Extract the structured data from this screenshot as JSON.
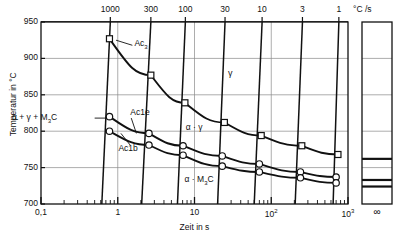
{
  "figure": {
    "kind": "continuous-heating-transformation-diagram",
    "axes": {
      "y": {
        "title": "Temperatur in °C",
        "min": 700,
        "max": 950,
        "ticks": [
          "700",
          "750",
          "800",
          "850",
          "900",
          "950"
        ],
        "tickvals": [
          700,
          750,
          800,
          850,
          900,
          950
        ]
      },
      "x": {
        "title": "Zeit in s",
        "min": -1,
        "max": 3,
        "ticks": [
          "0,1",
          "1",
          "10",
          "10",
          "10"
        ],
        "tick_labels": [
          "0,1",
          "1",
          "10",
          "10²",
          "10³"
        ],
        "tick_exponents": [
          "",
          "",
          "",
          "2",
          "3"
        ],
        "tickvals": [
          -1,
          0,
          1,
          2,
          3
        ],
        "infinity_label": "∞"
      },
      "top": {
        "title": "°C /s",
        "ticks": [
          "1000",
          "300",
          "100",
          "30",
          "10",
          "3",
          "1"
        ],
        "tickvals": [
          1000,
          300,
          100,
          30,
          10,
          3,
          1
        ]
      }
    },
    "region_labels": [
      {
        "name": "gamma",
        "text": "γ"
      },
      {
        "name": "alpha-gamma",
        "text": "α + γ"
      },
      {
        "name": "alpha-gamma-m3c",
        "text": "α + γ + M"
      },
      {
        "name": "alpha-m3c",
        "text": "α + M"
      }
    ],
    "region_labels_sub": {
      "m3c_sub": "3",
      "m3c_tail": "C"
    },
    "curve_labels": [
      {
        "name": "ac3",
        "text": "Ac",
        "sub": "3"
      },
      {
        "name": "ac1e",
        "text": "Ac1e"
      },
      {
        "name": "ac1b",
        "text": "Ac1b"
      }
    ],
    "colors": {
      "ink": "#111111",
      "grid": "#8a8a8a",
      "frame": "#111111"
    }
  },
  "chart_data": {
    "type": "line",
    "title": "",
    "xlabel": "Zeit in s",
    "ylabel": "Temperatur in °C",
    "xscale": "log",
    "xlim": [
      0.1,
      1000
    ],
    "ylim": [
      700,
      950
    ],
    "grid": true,
    "legend": "none",
    "top_axis": {
      "label": "°C /s",
      "name": "heating-rate",
      "values": [
        1000,
        300,
        100,
        30,
        10,
        3,
        1
      ]
    },
    "heating_rate_lines": [
      {
        "rate": 1000,
        "x_top": 0.8,
        "x_bottom": 0.62
      },
      {
        "rate": 300,
        "x_top": 2.7,
        "x_bottom": 2.05
      },
      {
        "rate": 100,
        "x_top": 7.6,
        "x_bottom": 6.0
      },
      {
        "rate": 30,
        "x_top": 25.0,
        "x_bottom": 20.0
      },
      {
        "rate": 10,
        "x_top": 76.0,
        "x_bottom": 60.0
      },
      {
        "rate": 3,
        "x_top": 255.0,
        "x_bottom": 205.0
      },
      {
        "rate": 1,
        "x_top": 760.0,
        "x_bottom": 640.0
      }
    ],
    "series": [
      {
        "name": "Ac3",
        "marker": "square",
        "x": [
          0.78,
          2.7,
          7.5,
          24.5,
          74.0,
          250.0,
          740.0
        ],
        "y": [
          927,
          877,
          839,
          812,
          794,
          780,
          768
        ]
      },
      {
        "name": "Ac1e",
        "marker": "circle",
        "x": [
          0.78,
          2.55,
          7.1,
          23.0,
          70.0,
          240.0,
          700.0
        ],
        "y": [
          820,
          797,
          780,
          766,
          755,
          744,
          737
        ]
      },
      {
        "name": "Ac1b",
        "marker": "circle",
        "x": [
          0.78,
          2.55,
          7.1,
          23.0,
          70.0,
          240.0,
          700.0
        ],
        "y": [
          800,
          781,
          767,
          752,
          744,
          736,
          729
        ]
      }
    ],
    "equilibrium_panel": {
      "x_label": "∞",
      "lines": [
        {
          "name": "Ac3-equilibrium",
          "y": 762
        },
        {
          "name": "Ac1e-equilibrium",
          "y": 733
        },
        {
          "name": "Ac1b-equilibrium",
          "y": 724
        }
      ]
    },
    "annotations": [
      {
        "name": "gamma-region",
        "text": "γ",
        "x": 30.0,
        "y": 878
      },
      {
        "name": "alpha-gamma-region",
        "text": "α + γ",
        "x": 11.0,
        "y": 805
      },
      {
        "name": "alpha-gamma-m3c-region",
        "text": "α + γ + M₃C",
        "x": 0.22,
        "y": 818
      },
      {
        "name": "alpha-m3c-region",
        "text": "α + M₃C",
        "x": 12.0,
        "y": 735
      },
      {
        "name": "ac3-label",
        "text": "Ac₃",
        "x": 2.0,
        "y": 915
      },
      {
        "name": "ac1e-label",
        "text": "Ac1e",
        "x": 1.35,
        "y": 823
      },
      {
        "name": "ac1b-label",
        "text": "Ac1b",
        "x": 1.05,
        "y": 773
      }
    ]
  }
}
